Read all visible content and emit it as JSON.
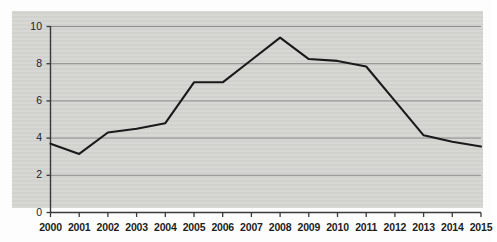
{
  "chart_data": {
    "type": "line",
    "title": "",
    "subtitle": "",
    "xlabel": "",
    "ylabel": "",
    "categories": [
      "2000",
      "2001",
      "2002",
      "2003",
      "2004",
      "2005",
      "2006",
      "2007",
      "2008",
      "2009",
      "2010",
      "2011",
      "2012",
      "2013",
      "2014",
      "2015"
    ],
    "values": [
      3.7,
      3.15,
      4.3,
      4.5,
      4.8,
      7.0,
      7.0,
      8.2,
      9.4,
      8.25,
      8.15,
      7.85,
      6.0,
      4.15,
      3.8,
      3.55
    ],
    "series": [
      {
        "name": "",
        "values": [
          3.7,
          3.15,
          4.3,
          4.5,
          4.8,
          7.0,
          7.0,
          8.2,
          9.4,
          8.25,
          8.15,
          7.85,
          6.0,
          4.15,
          3.8,
          3.55
        ]
      }
    ],
    "ylim": [
      0,
      10
    ],
    "yticks": [
      0,
      2,
      4,
      6,
      8,
      10
    ],
    "ytick_labels": [
      "0",
      "2",
      "4",
      "6",
      "8",
      "10"
    ],
    "xtick_labels": [
      "2000",
      "2001",
      "2002",
      "2003",
      "2004",
      "2005",
      "2006",
      "2007",
      "2008",
      "2009",
      "2010",
      "2011",
      "2012",
      "2013",
      "2014",
      "2015"
    ],
    "grid": "horizontal",
    "legend": "none",
    "annotations": [],
    "colors": {
      "line": "#1a1a1a",
      "grid": "#8c8c8c",
      "axis": "#3a3a3a",
      "panel_background": "#d5d5d2",
      "page_background": "#fdfdfd",
      "tick_label": "#1d1d1d"
    }
  }
}
